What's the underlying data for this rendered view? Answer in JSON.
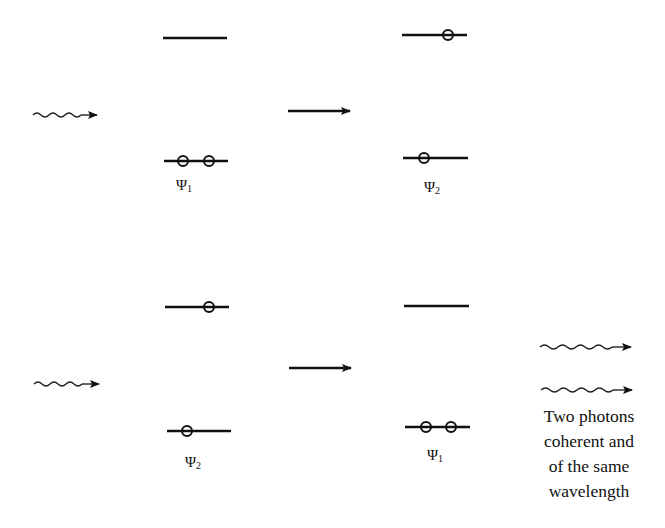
{
  "figure": {
    "top_row": {
      "left_state": {
        "label": "Ψ",
        "subscript": "1",
        "upper_level_electrons": 0,
        "lower_level_electrons": 2
      },
      "right_state": {
        "label": "Ψ",
        "subscript": "2",
        "upper_level_electrons": 1,
        "lower_level_electrons": 1
      },
      "incoming_photons": 1
    },
    "bottom_row": {
      "left_state": {
        "label": "Ψ",
        "subscript": "2",
        "upper_level_electrons": 1,
        "lower_level_electrons": 1
      },
      "right_state": {
        "label": "Ψ",
        "subscript": "1",
        "upper_level_electrons": 0,
        "lower_level_electrons": 2
      },
      "incoming_photons": 1,
      "outgoing_photons": 2
    },
    "caption_lines": [
      "Two photons",
      "coherent and",
      "of the same",
      "wavelength"
    ],
    "colors": {
      "ink": "#111111",
      "background": "#ffffff"
    }
  }
}
